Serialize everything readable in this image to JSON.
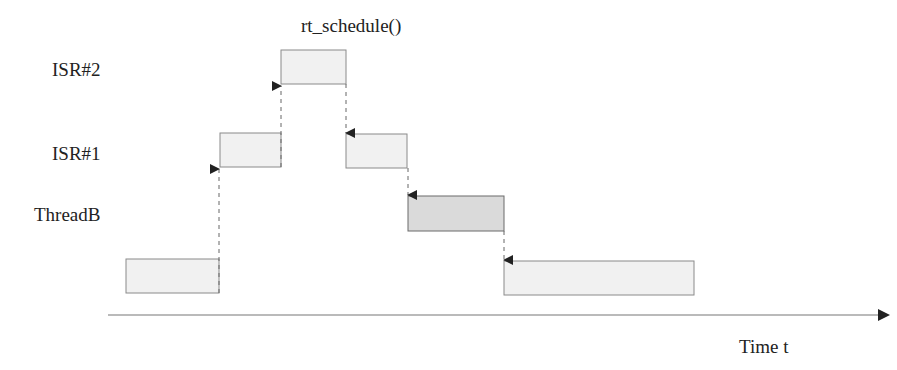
{
  "diagram": {
    "type": "interrupt-timing",
    "labels": {
      "isr2": "ISR#2",
      "isr1": "ISR#1",
      "threadB": "ThreadB",
      "schedule": "rt_schedule()",
      "time_axis": "Time t"
    },
    "colors": {
      "light_box": "#f1f1f1",
      "dark_box": "#dadada",
      "stroke": "#7a7a7a",
      "arrow": "#222222"
    }
  }
}
